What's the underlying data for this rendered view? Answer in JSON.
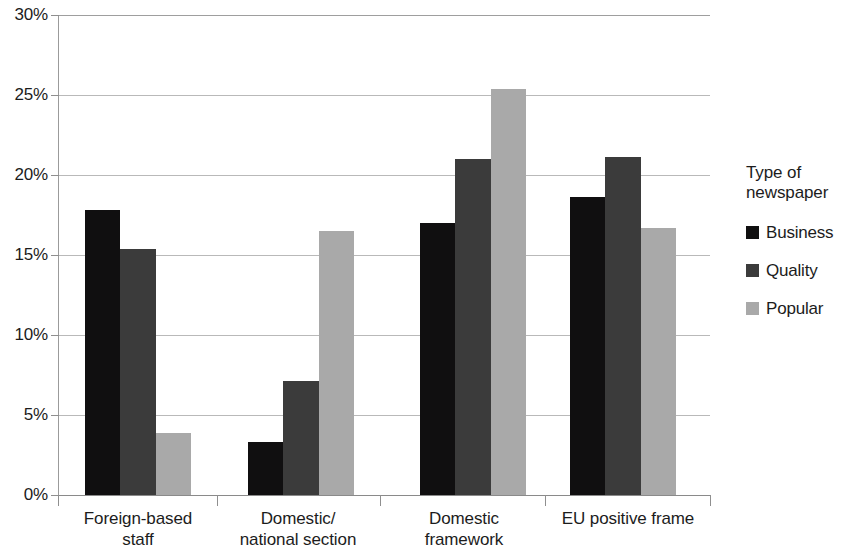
{
  "chart_data": {
    "type": "bar",
    "title": "",
    "xlabel": "",
    "ylabel": "",
    "ylim": [
      0,
      30
    ],
    "y_tick_labels": [
      "0%",
      "5%",
      "10%",
      "15%",
      "20%",
      "25%",
      "30%"
    ],
    "y_tick_values": [
      0,
      5,
      10,
      15,
      20,
      25,
      30
    ],
    "grid": true,
    "legend_position": "right",
    "legend_title": "Type of\nnewspaper",
    "categories": [
      "Foreign-based\nstaff",
      "Domestic/\nnational section",
      "Domestic\nframework",
      "EU positive frame"
    ],
    "series": [
      {
        "name": "Business",
        "color": "#100f10",
        "values": [
          17.8,
          3.3,
          17.0,
          18.6
        ]
      },
      {
        "name": "Quality",
        "color": "#3b3b3b",
        "values": [
          15.4,
          7.1,
          21.0,
          21.1
        ]
      },
      {
        "name": "Popular",
        "color": "#a9a9a9",
        "values": [
          3.9,
          16.5,
          25.4,
          16.7
        ]
      }
    ]
  },
  "legend": {
    "title": "Type of\nnewspaper",
    "items": [
      {
        "label": "Business",
        "swatch": "s0"
      },
      {
        "label": "Quality",
        "swatch": "s1"
      },
      {
        "label": "Popular",
        "swatch": "s2"
      }
    ]
  }
}
